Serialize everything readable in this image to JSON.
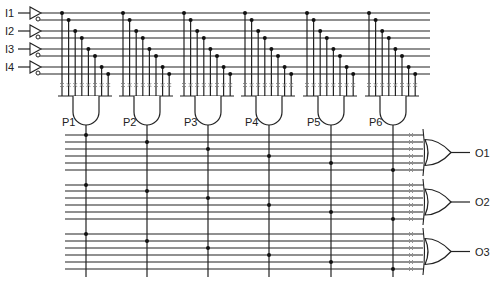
{
  "diagram": {
    "type": "PLA",
    "inputs": [
      {
        "label": "I1",
        "y": 13
      },
      {
        "label": "I2",
        "y": 31
      },
      {
        "label": "I3",
        "y": 49
      },
      {
        "label": "I4",
        "y": 67
      }
    ],
    "products": [
      {
        "label": "P1",
        "x": 62
      },
      {
        "label": "P2",
        "x": 123
      },
      {
        "label": "P3",
        "x": 184
      },
      {
        "label": "P4",
        "x": 245
      },
      {
        "label": "P5",
        "x": 307
      },
      {
        "label": "P6",
        "x": 369
      }
    ],
    "outputs": [
      {
        "label": "O1"
      },
      {
        "label": "O2"
      },
      {
        "label": "O3"
      }
    ],
    "colors": {
      "line": "#222222",
      "fuse": "#888888",
      "dot": "#111111"
    }
  }
}
